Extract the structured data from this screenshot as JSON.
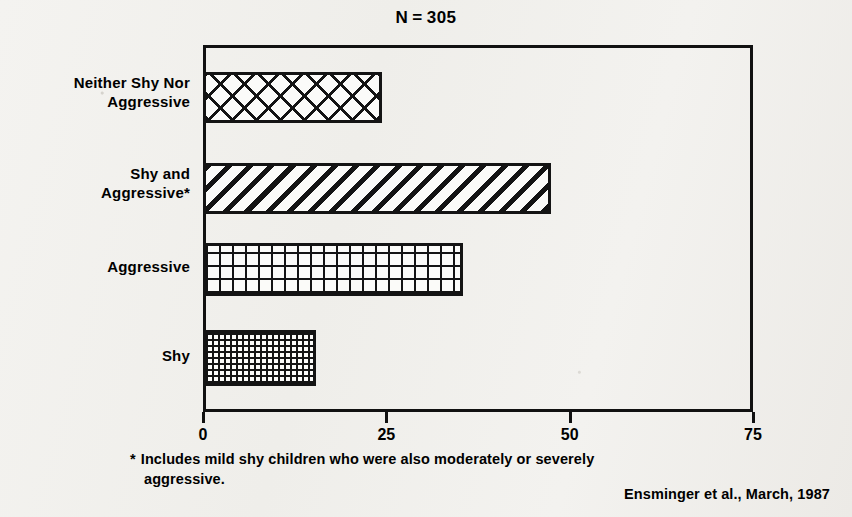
{
  "chart_data": {
    "type": "bar",
    "orientation": "horizontal",
    "title_prefix": "N",
    "title_operator": "=",
    "title_value": "305",
    "categories": [
      "Shy",
      "Aggressive",
      "Shy and Aggressive*",
      "Neither Shy Nor Aggressive"
    ],
    "values": [
      15,
      35,
      47,
      24
    ],
    "series": [
      {
        "name": "Percent of children",
        "values": [
          15,
          35,
          47,
          24
        ]
      }
    ],
    "bars": [
      {
        "label_line1": "Neither Shy Nor",
        "label_line2": "Aggressive",
        "value": 24,
        "pattern": "diamond-lattice"
      },
      {
        "label_line1": "Shy and",
        "label_line2": "Aggressive*",
        "value": 47,
        "pattern": "diagonal-hatch"
      },
      {
        "label_line1": "Aggressive",
        "label_line2": "",
        "value": 35,
        "pattern": "square-grid"
      },
      {
        "label_line1": "Shy",
        "label_line2": "",
        "value": 15,
        "pattern": "fine-dots"
      }
    ],
    "xlabel": "",
    "ylabel": "",
    "xlim": [
      0,
      75
    ],
    "xticks": [
      0,
      25,
      50,
      75
    ],
    "xtick_labels": [
      "0",
      "25",
      "50",
      "75"
    ],
    "grid": false,
    "legend": "none",
    "bar_color": "#141414",
    "background_color": "#f2f1ee"
  },
  "footnote": {
    "marker": "*",
    "line1": "Includes mild shy children who were also moderately or severely",
    "line2": "aggressive."
  },
  "attribution": {
    "text": "Ensminger et al., March, 1987"
  }
}
